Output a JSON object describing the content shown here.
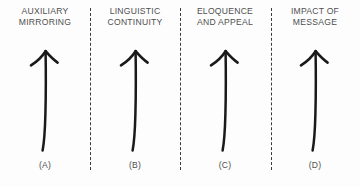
{
  "figure": {
    "background_color": "#fdfdfd",
    "text_color": "#4f4f4f",
    "stroke_color": "#1a1a1a",
    "divider_color": "#3b3b3b",
    "divider_count": 3
  },
  "panels": [
    {
      "heading": "AUXILIARY\nMIRRORING",
      "label": "(A)",
      "icon": "up-arrow-icon"
    },
    {
      "heading": "LINGUISTIC\nCONTINUITY",
      "label": "(B)",
      "icon": "up-arrow-icon"
    },
    {
      "heading": "ELOQUENCE\nAND APPEAL",
      "label": "(C)",
      "icon": "up-arrow-icon"
    },
    {
      "heading": "IMPACT OF\nMESSAGE",
      "label": "(D)",
      "icon": "up-arrow-icon"
    }
  ]
}
